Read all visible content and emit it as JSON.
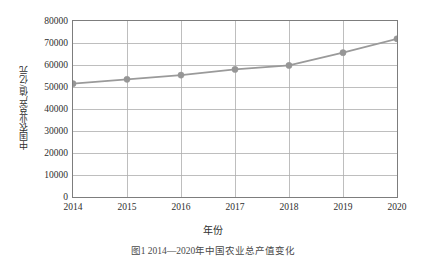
{
  "chart_data": {
    "type": "line",
    "title": "",
    "xlabel": "年份",
    "ylabel": "中国农业总产值/亿元",
    "categories": [
      "2014",
      "2015",
      "2016",
      "2017",
      "2018",
      "2019",
      "2020"
    ],
    "x": [
      2014,
      2015,
      2016,
      2017,
      2018,
      2019,
      2020
    ],
    "values": [
      51500,
      53500,
      55400,
      58000,
      59800,
      65600,
      71900
    ],
    "series": [
      {
        "name": "中国农业总产值",
        "values": [
          51500,
          53500,
          55400,
          58000,
          59800,
          65600,
          71900
        ]
      }
    ],
    "ylim": [
      0,
      80000
    ],
    "yticks": [
      0,
      10000,
      20000,
      30000,
      40000,
      50000,
      60000,
      70000,
      80000
    ],
    "ytick_labels": [
      "0",
      "10000",
      "20000",
      "30000",
      "40000",
      "50000",
      "60000",
      "70000",
      "80000"
    ],
    "xlim": [
      2014,
      2020
    ],
    "grid": true,
    "legend": "none",
    "line_color": "#9a9a9a",
    "marker_color": "#969696",
    "marker": "circle",
    "grid_color": "#aeaeae",
    "axis_color": "#7d7d7d"
  },
  "caption": {
    "text": "图1  2014—2020年中国农业总产值变化"
  }
}
